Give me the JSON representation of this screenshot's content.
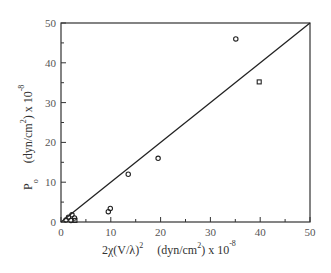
{
  "chart_data": {
    "type": "scatter",
    "title": "",
    "xlabel": {
      "main": "2χ(V/λ)",
      "main_sup": "2",
      "unit": "(dyn/cm",
      "unit_sup": "2",
      "unit_tail": ") x 10",
      "exp_sup": "-8"
    },
    "ylabel": {
      "main": "P",
      "main_sub": "o",
      "unit": "(dyn/cm",
      "unit_sup": "2",
      "unit_tail": ") x 10",
      "exp_sup": "-8"
    },
    "xlim": [
      0,
      50
    ],
    "ylim": [
      0,
      50
    ],
    "x_ticks": [
      0,
      10,
      20,
      30,
      40,
      50
    ],
    "y_ticks": [
      0,
      10,
      20,
      30,
      40,
      50
    ],
    "x_ticks_labels": [
      "0",
      "10",
      "20",
      "30",
      "40",
      "50"
    ],
    "y_ticks_labels": [
      "0",
      "10",
      "20",
      "30",
      "40",
      "50"
    ],
    "minor_tick_step": 5,
    "grid": false,
    "legend": null,
    "reference_line": {
      "label": "y = x",
      "from": [
        0,
        0
      ],
      "to": [
        50,
        50
      ]
    },
    "series": [
      {
        "name": "circles",
        "marker": "circle",
        "points": [
          [
            1.0,
            0.5
          ],
          [
            1.5,
            1.2
          ],
          [
            2.2,
            1.8
          ],
          [
            2.0,
            0.4
          ],
          [
            2.7,
            1.0
          ],
          [
            9.5,
            2.6
          ],
          [
            9.9,
            3.4
          ],
          [
            13.5,
            12.0
          ],
          [
            19.5,
            16.0
          ],
          [
            35.1,
            46.0
          ]
        ]
      },
      {
        "name": "squares",
        "marker": "square",
        "points": [
          [
            2.8,
            0.4
          ],
          [
            39.8,
            35.2
          ]
        ]
      }
    ]
  },
  "colors": {
    "axis": "#333333",
    "marker": "#222222",
    "line": "#222222"
  }
}
